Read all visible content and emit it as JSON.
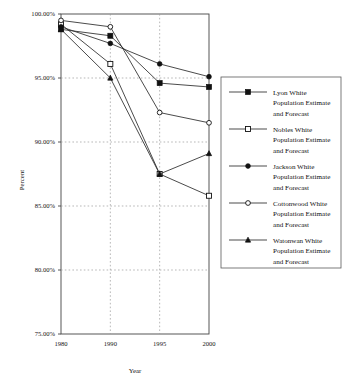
{
  "chart_data": {
    "type": "line",
    "title": "",
    "xlabel": "Year",
    "ylabel": "Percent",
    "x": [
      1980,
      1990,
      1995,
      2000
    ],
    "xtick_labels": [
      "1980",
      "1990",
      "1995",
      "2000"
    ],
    "ytick_labels": [
      "100.00%",
      "95.00%",
      "90.00%",
      "85.00%",
      "80.00%",
      "75.00%"
    ],
    "ytick_values": [
      100,
      95,
      90,
      85,
      80,
      75
    ],
    "ylim": [
      75,
      100
    ],
    "yunit": "percent",
    "grid": "horizontal-and-vertical-dotted",
    "legend_position": "right",
    "series": [
      {
        "name": "Lyon White Population Estimate and Forecast",
        "short_name": "Lyon",
        "marker": "filled-square",
        "values": [
          98.8,
          98.3,
          94.6,
          94.3
        ]
      },
      {
        "name": "Nobles White Population Estimate and Forecast",
        "short_name": "Nobles",
        "marker": "open-square",
        "values": [
          99.2,
          96.1,
          87.5,
          85.8
        ]
      },
      {
        "name": "Jackson White Population Estimate and Forecast",
        "short_name": "Jackson",
        "marker": "filled-circle",
        "values": [
          99.0,
          97.7,
          96.1,
          95.1
        ]
      },
      {
        "name": "Cottonwood White Population Estimate and Forecast",
        "short_name": "Cottonwood",
        "marker": "open-circle",
        "values": [
          99.5,
          99.0,
          92.3,
          91.5
        ]
      },
      {
        "name": "Watonwan White Population Estimate and Forecast",
        "short_name": "Watonwan",
        "marker": "filled-triangle",
        "values": [
          98.8,
          95.0,
          87.5,
          89.1
        ]
      }
    ]
  },
  "legend": {
    "entries": [
      {
        "line1": "Lyon White",
        "line2": "Population Estimate",
        "line3": "and Forecast"
      },
      {
        "line1": "Nobles White",
        "line2": "Population Estimate",
        "line3": "and Forecast"
      },
      {
        "line1": "Jackson White",
        "line2": "Population Estimate",
        "line3": "and Forecast"
      },
      {
        "line1": "Cottonwood White",
        "line2": "Population Estimate",
        "line3": "and Forecast"
      },
      {
        "line1": "Watonwan White",
        "line2": "Population Estimate",
        "line3": "and Forecast"
      }
    ]
  },
  "axes": {
    "y_title": "Percent",
    "x_title": "Year",
    "y_labels": [
      "100.00%",
      "95.00%",
      "90.00%",
      "85.00%",
      "80.00%",
      "75.00%"
    ],
    "x_labels": [
      "1980",
      "1990",
      "1995",
      "2000"
    ]
  }
}
